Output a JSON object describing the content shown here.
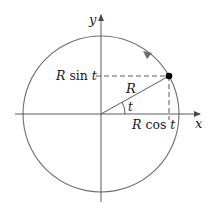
{
  "diagram": {
    "axes": {
      "x_label": "x",
      "y_label": "y"
    },
    "labels": {
      "radius": "R",
      "angle": "t",
      "y_projection": "R sin t",
      "x_projection": "R cos t"
    },
    "label_parts": {
      "sin_R": "R",
      "sin_fn": "sin",
      "sin_t": "t",
      "cos_R": "R",
      "cos_fn": "cos",
      "cos_t": "t"
    },
    "colors": {
      "circle": "#6e6e6e",
      "axes": "#4a4a4a",
      "point": "#000000",
      "text": "#1a1a1a"
    },
    "direction": "counterclockwise"
  }
}
